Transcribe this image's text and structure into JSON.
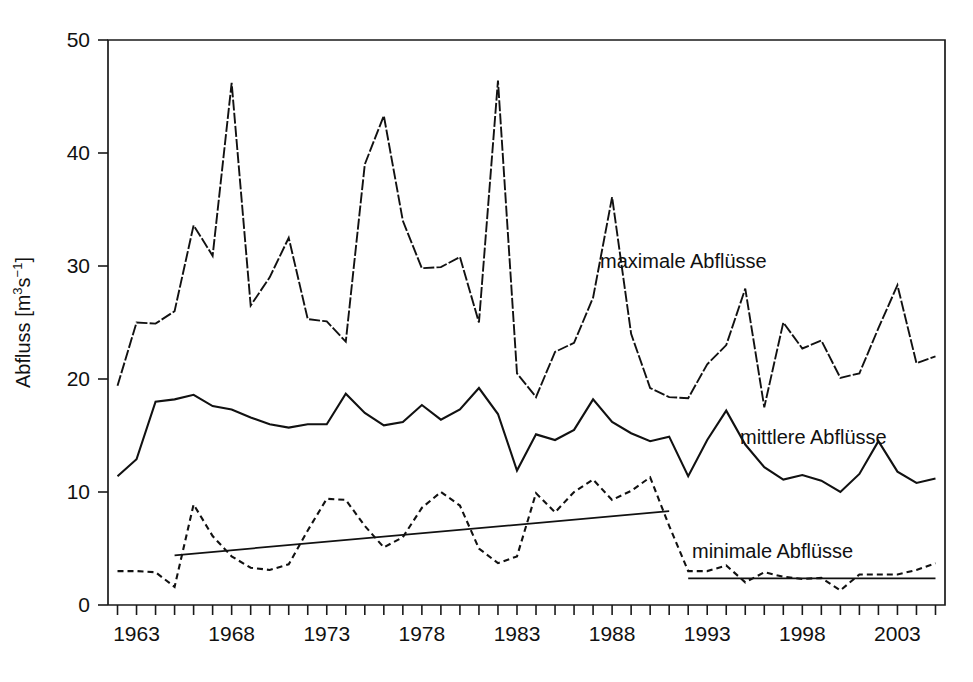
{
  "chart_data": {
    "type": "line",
    "title": "",
    "xlabel": "",
    "ylabel": "Abfluss [m3s-1]",
    "ylabel_parts": {
      "main": "Abfluss [m",
      "sup1": "3",
      "mid": "s",
      "sup2": "−1",
      "end": "]"
    },
    "xlim": [
      1961.5,
      2005.5
    ],
    "ylim": [
      0,
      50
    ],
    "grid": false,
    "legend_position": "inline-annotations",
    "y_ticks": [
      0,
      10,
      20,
      30,
      40,
      50
    ],
    "y_tick_labels": [
      "0",
      "10",
      "20",
      "30",
      "40",
      "50"
    ],
    "x_ticks": [
      1962,
      1963,
      1964,
      1965,
      1966,
      1967,
      1968,
      1969,
      1970,
      1971,
      1972,
      1973,
      1974,
      1975,
      1976,
      1977,
      1978,
      1979,
      1980,
      1981,
      1982,
      1983,
      1984,
      1985,
      1986,
      1987,
      1988,
      1989,
      1990,
      1991,
      1992,
      1993,
      1994,
      1995,
      1996,
      1997,
      1998,
      1999,
      2000,
      2001,
      2002,
      2003,
      2004,
      2005
    ],
    "x_tick_labels_shown": [
      "1963",
      "1968",
      "1973",
      "1978",
      "1983",
      "1988",
      "1993",
      "1998",
      "2003"
    ],
    "x_label_years": [
      1963,
      1968,
      1973,
      1978,
      1983,
      1988,
      1993,
      1998,
      2003
    ],
    "x": [
      1962,
      1963,
      1964,
      1965,
      1966,
      1967,
      1968,
      1969,
      1970,
      1971,
      1972,
      1973,
      1974,
      1975,
      1976,
      1977,
      1978,
      1979,
      1980,
      1981,
      1982,
      1983,
      1984,
      1985,
      1986,
      1987,
      1988,
      1989,
      1990,
      1991,
      1992,
      1993,
      1994,
      1995,
      1996,
      1997,
      1998,
      1999,
      2000,
      2001,
      2002,
      2003,
      2004,
      2005
    ],
    "series": [
      {
        "name": "maximale Abflüsse",
        "style": "dash-dot",
        "annotation": "maximale Abflüsse",
        "values": [
          19.4,
          25.0,
          24.9,
          26.0,
          33.6,
          30.9,
          46.2,
          26.5,
          29.0,
          32.5,
          25.3,
          25.1,
          23.3,
          39.0,
          43.3,
          34.0,
          29.8,
          29.9,
          30.8,
          25.0,
          46.4,
          20.5,
          18.4,
          22.4,
          23.2,
          27.2,
          36.1,
          24.0,
          19.2,
          18.4,
          18.3,
          21.3,
          23.0,
          28.0,
          17.5,
          25.0,
          22.7,
          23.4,
          20.1,
          20.5,
          24.5,
          28.3,
          21.4,
          22.0
        ]
      },
      {
        "name": "mittlere Abflüsse",
        "style": "solid",
        "annotation": "mittlere Abflüsse",
        "values": [
          11.4,
          12.9,
          18.0,
          18.2,
          18.6,
          17.6,
          17.3,
          16.6,
          16.0,
          15.7,
          16.0,
          16.0,
          18.7,
          17.0,
          15.9,
          16.2,
          17.7,
          16.4,
          17.3,
          19.2,
          16.9,
          11.9,
          15.1,
          14.6,
          15.5,
          18.2,
          16.2,
          15.2,
          14.5,
          14.9,
          11.4,
          14.6,
          17.2,
          14.2,
          12.2,
          11.1,
          11.5,
          11.0,
          10.0,
          11.6,
          14.5,
          11.8,
          10.8,
          11.2
        ]
      },
      {
        "name": "minimale Abflüsse",
        "style": "dashed",
        "annotation": "minimale Abflüsse",
        "values": [
          3.0,
          3.0,
          2.9,
          1.6,
          8.9,
          6.1,
          4.3,
          3.3,
          3.1,
          3.6,
          6.6,
          9.4,
          9.3,
          7.0,
          5.1,
          6.0,
          8.6,
          10.0,
          8.8,
          5.0,
          3.7,
          4.3,
          9.9,
          8.2,
          10.0,
          11.1,
          9.3,
          10.1,
          11.3,
          7.0,
          3.0,
          3.0,
          3.5,
          2.0,
          2.9,
          2.5,
          2.3,
          2.4,
          1.3,
          2.7,
          2.7,
          2.7,
          3.1,
          3.7
        ]
      }
    ],
    "trendlines": [
      {
        "name": "minimale-trend-1",
        "x": [
          1965,
          1991
        ],
        "y": [
          4.4,
          8.3
        ]
      },
      {
        "name": "minimale-trend-2",
        "x": [
          1992,
          2005
        ],
        "y": [
          2.35,
          2.35
        ]
      }
    ]
  }
}
